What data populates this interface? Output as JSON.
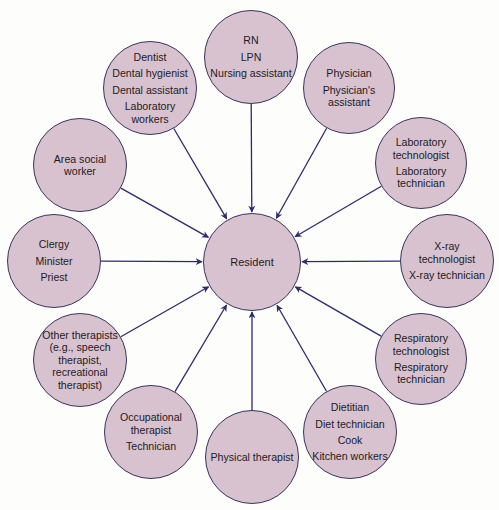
{
  "diagram": {
    "center": {
      "label": "Resident",
      "x": 252,
      "y": 262,
      "r": 49
    },
    "nodes": [
      {
        "id": "nursing",
        "x": 251,
        "y": 57,
        "r": 47,
        "lines": [
          "RN",
          "LPN",
          "Nursing assistant"
        ]
      },
      {
        "id": "physician",
        "x": 349,
        "y": 88,
        "r": 46,
        "lines": [
          "Physician",
          "Physician's assistant"
        ]
      },
      {
        "id": "laboratory",
        "x": 421,
        "y": 163,
        "r": 46,
        "lines": [
          "Laboratory technologist",
          "Laboratory technician"
        ]
      },
      {
        "id": "xray",
        "x": 447,
        "y": 261,
        "r": 47,
        "lines": [
          "X-ray technologist",
          "X-ray technician"
        ]
      },
      {
        "id": "respiratory",
        "x": 421,
        "y": 359,
        "r": 46,
        "lines": [
          "Respiratory technologist",
          "Respiratory technician"
        ]
      },
      {
        "id": "dietary",
        "x": 350,
        "y": 432,
        "r": 47,
        "lines": [
          "Dietitian",
          "Diet technician",
          "Cook",
          "Kitchen workers"
        ]
      },
      {
        "id": "physical",
        "x": 252,
        "y": 457,
        "r": 47,
        "lines": [
          "Physical therapist"
        ]
      },
      {
        "id": "occupational",
        "x": 151,
        "y": 432,
        "r": 47,
        "lines": [
          "Occupational therapist",
          "Technician"
        ]
      },
      {
        "id": "other",
        "x": 80,
        "y": 360,
        "r": 47,
        "lines": [
          "Other therapists (e.g., speech therapist, recreational therapist)"
        ]
      },
      {
        "id": "clergy",
        "x": 54,
        "y": 261,
        "r": 47,
        "lines": [
          "Clergy",
          "Minister",
          "Priest"
        ]
      },
      {
        "id": "social",
        "x": 80,
        "y": 165,
        "r": 47,
        "lines": [
          "Area social worker"
        ]
      },
      {
        "id": "dental",
        "x": 150,
        "y": 88,
        "r": 47,
        "lines": [
          "Dentist",
          "Dental hygienist",
          "Dental assistant",
          "Laboratory workers"
        ]
      }
    ],
    "colors": {
      "node_fill": "#d8c2cf",
      "node_stroke": "#3a3560",
      "arrow": "#2e2a6e",
      "text": "#1e1a1e"
    }
  }
}
